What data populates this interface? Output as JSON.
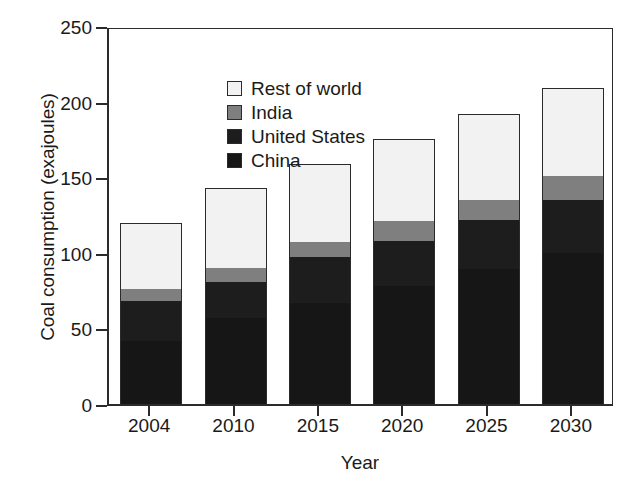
{
  "chart_data": {
    "type": "bar",
    "subtype": "stacked-bar",
    "title": "",
    "xlabel": "Year",
    "ylabel": "Coal consumption (exajoules)",
    "categories": [
      "2004",
      "2010",
      "2015",
      "2020",
      "2025",
      "2030"
    ],
    "ylim": [
      0,
      250
    ],
    "yticks": [
      0,
      50,
      100,
      150,
      200,
      250
    ],
    "ytick_labels": [
      "0",
      "50",
      "100",
      "150",
      "200",
      "250"
    ],
    "grid": false,
    "legend_position": "upper-left-inside",
    "stack_order_bottom_to_top": [
      "China",
      "United States",
      "India",
      "Rest of world"
    ],
    "series": [
      {
        "name": "China",
        "color": "#161616",
        "values": [
          42,
          57,
          67,
          78,
          89,
          100
        ]
      },
      {
        "name": "United States",
        "color": "#1d1d1d",
        "values": [
          26,
          24,
          30,
          30,
          33,
          35
        ]
      },
      {
        "name": "India",
        "color": "#7f7f7f",
        "values": [
          8,
          9,
          10,
          13,
          13,
          16
        ]
      },
      {
        "name": "Rest of world",
        "color": "#f2f2f2",
        "values": [
          44,
          53,
          52,
          54,
          57,
          58
        ]
      }
    ],
    "totals": [
      120,
      143,
      159,
      175,
      192,
      209
    ],
    "annotations": []
  },
  "legend": {
    "items": [
      {
        "label": "Rest of world",
        "color": "#f2f2f2"
      },
      {
        "label": "India",
        "color": "#7f7f7f"
      },
      {
        "label": "United States",
        "color": "#1d1d1d"
      },
      {
        "label": "China",
        "color": "#161616"
      }
    ]
  },
  "axes": {
    "y_title": "Coal consumption (exajoules)",
    "x_title": "Year"
  },
  "colors": {
    "axis": "#2b2b2b",
    "background": "#ffffff",
    "text": "#1a1a1a"
  }
}
